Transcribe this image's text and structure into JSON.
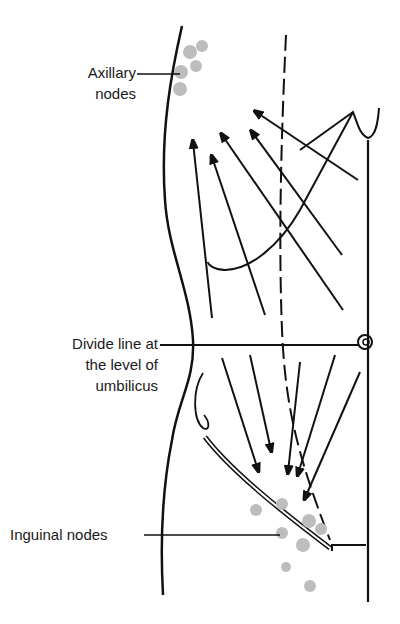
{
  "figure": {
    "type": "anatomical lymphatic drainage diagram",
    "labels": {
      "axillary": [
        "Axillary",
        "nodes"
      ],
      "divide": [
        "Divide line at",
        "the level of",
        "umbilicus"
      ],
      "inguinal": "Inguinal nodes"
    },
    "colors": {
      "line": "#111111",
      "node": "#bdbdbd",
      "background": "#ffffff"
    },
    "arrows_upper_count": 5,
    "arrows_lower_count": 6,
    "axillary_node_count": 5,
    "inguinal_node_count": 9
  }
}
